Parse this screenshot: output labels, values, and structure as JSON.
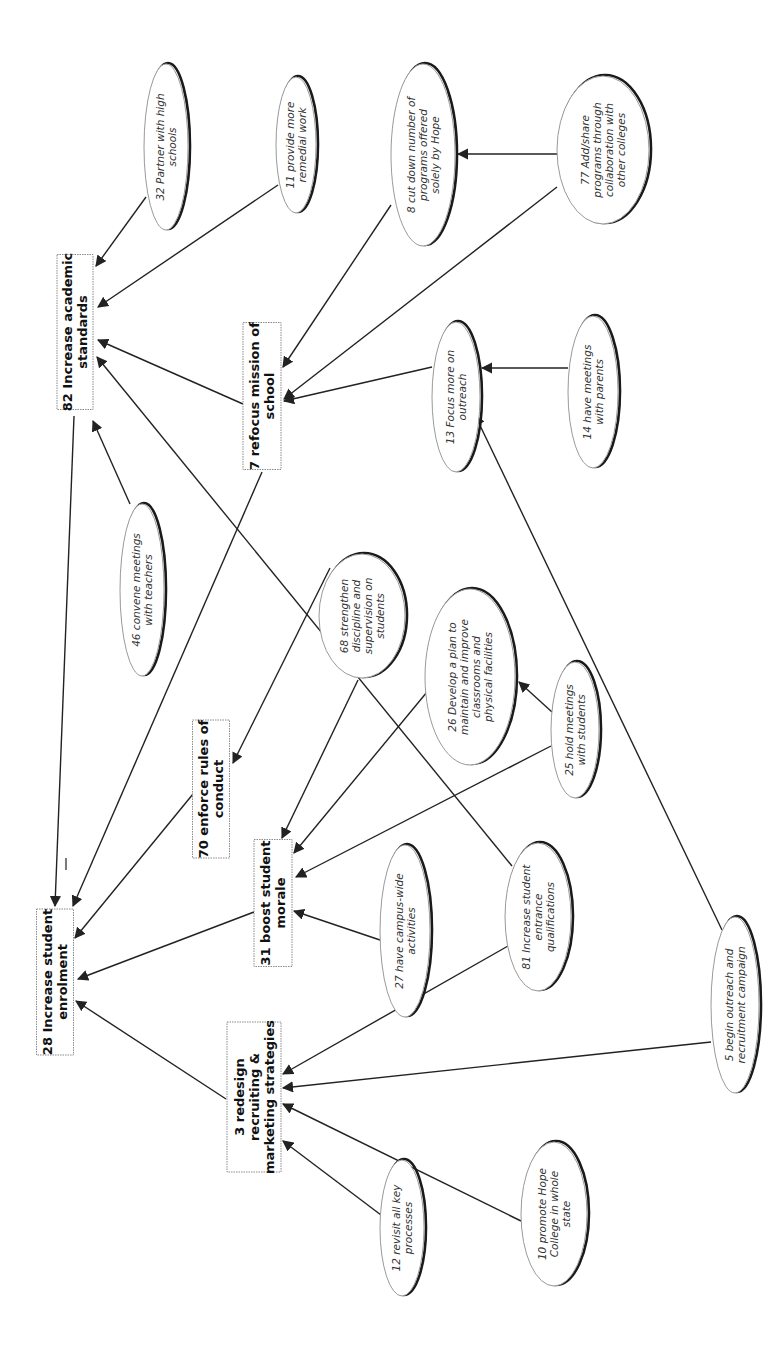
{
  "diagram": {
    "orientation": "rotated -90 degrees (text reads bottom-to-top)",
    "nodes": [
      {
        "id": "82",
        "type": "box",
        "lines": [
          "82 Increase academic",
          "standards"
        ],
        "cx": 75,
        "cy": 332,
        "w": 36,
        "h": 155
      },
      {
        "id": "7",
        "type": "box",
        "lines": [
          "7 refocus mission of",
          "school"
        ],
        "cx": 262,
        "cy": 396,
        "w": 38,
        "h": 147
      },
      {
        "id": "70",
        "type": "box",
        "lines": [
          "70 enforce rules of",
          "conduct"
        ],
        "cx": 211,
        "cy": 789,
        "w": 37,
        "h": 138
      },
      {
        "id": "28",
        "type": "box",
        "lines": [
          "28 Increase student",
          "enrolment"
        ],
        "cx": 55,
        "cy": 982,
        "w": 37,
        "h": 146
      },
      {
        "id": "31",
        "type": "box",
        "lines": [
          "31 boost student",
          "morale"
        ],
        "cx": 273,
        "cy": 903,
        "w": 38,
        "h": 127
      },
      {
        "id": "3",
        "type": "box",
        "lines": [
          "3 redesign",
          "recruiting &",
          "marketing strategies"
        ],
        "cx": 254,
        "cy": 1097,
        "w": 54,
        "h": 150
      },
      {
        "id": "32",
        "type": "oval",
        "lines": [
          "32 Partner with high",
          "schools"
        ],
        "cx": 166,
        "cy": 147,
        "rx": 22,
        "ry": 83
      },
      {
        "id": "11",
        "type": "oval",
        "lines": [
          "11 provide more",
          "remedial work"
        ],
        "cx": 296,
        "cy": 145,
        "rx": 20,
        "ry": 68
      },
      {
        "id": "8",
        "type": "oval",
        "lines": [
          "8 cut down number of",
          "programs offered",
          "solely by Hope"
        ],
        "cx": 423,
        "cy": 155,
        "rx": 32,
        "ry": 91
      },
      {
        "id": "77",
        "type": "oval",
        "lines": [
          "77 Add/share",
          "programs through",
          "collaboration with",
          "other colleges"
        ],
        "cx": 603,
        "cy": 150,
        "rx": 46,
        "ry": 74
      },
      {
        "id": "13",
        "type": "oval",
        "lines": [
          "13 Focus more on",
          "outreach"
        ],
        "cx": 456,
        "cy": 397,
        "rx": 24,
        "ry": 75
      },
      {
        "id": "14",
        "type": "oval",
        "lines": [
          "14 have meetings",
          "with parents"
        ],
        "cx": 593,
        "cy": 392,
        "rx": 25,
        "ry": 76
      },
      {
        "id": "46",
        "type": "oval",
        "lines": [
          "46 convene meetings",
          "with teachers"
        ],
        "cx": 142,
        "cy": 590,
        "rx": 22,
        "ry": 86
      },
      {
        "id": "68",
        "type": "oval",
        "lines": [
          "68 strengthen",
          "discipline and",
          "supervision on",
          "students"
        ],
        "cx": 362,
        "cy": 616,
        "rx": 43,
        "ry": 62
      },
      {
        "id": "26",
        "type": "oval",
        "lines": [
          "26 Develop a plan to",
          "maintain and improve",
          "classrooms and",
          "physical facilities"
        ],
        "cx": 470,
        "cy": 677,
        "rx": 45,
        "ry": 88
      },
      {
        "id": "25",
        "type": "oval",
        "lines": [
          "25 hold meetings",
          "with students"
        ],
        "cx": 575,
        "cy": 730,
        "rx": 24,
        "ry": 68
      },
      {
        "id": "27",
        "type": "oval",
        "lines": [
          "27 have campus-wide",
          "activities"
        ],
        "cx": 405,
        "cy": 931,
        "rx": 25,
        "ry": 86
      },
      {
        "id": "81",
        "type": "oval",
        "lines": [
          "81 Increase student",
          "entrance",
          "qualifications"
        ],
        "cx": 538,
        "cy": 917,
        "rx": 33,
        "ry": 74
      },
      {
        "id": "5",
        "type": "oval",
        "lines": [
          "5 begin outreach and",
          "recruitment campaign"
        ],
        "cx": 735,
        "cy": 1005,
        "rx": 24,
        "ry": 88
      },
      {
        "id": "12",
        "type": "oval",
        "lines": [
          "12 revisit all key",
          "processes"
        ],
        "cx": 402,
        "cy": 1228,
        "rx": 22,
        "ry": 68
      },
      {
        "id": "10",
        "type": "oval",
        "lines": [
          "10 promote Hope",
          "College in whole",
          "state"
        ],
        "cx": 554,
        "cy": 1214,
        "rx": 33,
        "ry": 72
      }
    ],
    "edges": [
      {
        "from": "32",
        "to": "82",
        "x1": 146,
        "y1": 197,
        "x2": 96,
        "y2": 266
      },
      {
        "from": "11",
        "to": "82",
        "x1": 278,
        "y1": 185,
        "x2": 98,
        "y2": 307
      },
      {
        "from": "7",
        "to": "82",
        "x1": 243,
        "y1": 404,
        "x2": 98,
        "y2": 340
      },
      {
        "from": "81",
        "to": "82",
        "x1": 512,
        "y1": 866,
        "x2": 97,
        "y2": 357
      },
      {
        "from": "46",
        "to": "82",
        "x1": 130,
        "y1": 504,
        "x2": 93,
        "y2": 421
      },
      {
        "from": "8",
        "to": "7",
        "x1": 391,
        "y1": 205,
        "x2": 283,
        "y2": 367
      },
      {
        "from": "77",
        "to": "7",
        "x1": 557,
        "y1": 187,
        "x2": 284,
        "y2": 399
      },
      {
        "from": "13",
        "to": "7",
        "x1": 432,
        "y1": 367,
        "x2": 284,
        "y2": 401
      },
      {
        "from": "77",
        "to": "8",
        "x1": 557,
        "y1": 154,
        "x2": 458,
        "y2": 154
      },
      {
        "from": "14",
        "to": "13",
        "x1": 568,
        "y1": 368,
        "x2": 482,
        "y2": 368
      },
      {
        "from": "5",
        "to": "13",
        "x1": 722,
        "y1": 930,
        "x2": 475,
        "y2": 415
      },
      {
        "from": "82",
        "to": "28",
        "x1": 74,
        "y1": 416,
        "x2": 55,
        "y2": 906
      },
      {
        "from": "7",
        "to": "28",
        "x1": 262,
        "y1": 472,
        "x2": 73,
        "y2": 906
      },
      {
        "from": "70",
        "to": "28",
        "x1": 193,
        "y1": 794,
        "x2": 75,
        "y2": 938
      },
      {
        "from": "31",
        "to": "28",
        "x1": 254,
        "y1": 912,
        "x2": 78,
        "y2": 979
      },
      {
        "from": "3",
        "to": "28",
        "x1": 226,
        "y1": 1099,
        "x2": 76,
        "y2": 1001
      },
      {
        "from": "68",
        "to": "70",
        "x1": 330,
        "y1": 568,
        "x2": 233,
        "y2": 763
      },
      {
        "from": "68",
        "to": "31",
        "x1": 358,
        "y1": 680,
        "x2": 282,
        "y2": 838
      },
      {
        "from": "26",
        "to": "31",
        "x1": 427,
        "y1": 692,
        "x2": 294,
        "y2": 853
      },
      {
        "from": "25",
        "to": "31",
        "x1": 551,
        "y1": 746,
        "x2": 296,
        "y2": 877
      },
      {
        "from": "27",
        "to": "31",
        "x1": 380,
        "y1": 940,
        "x2": 294,
        "y2": 911
      },
      {
        "from": "25",
        "to": "26",
        "x1": 552,
        "y1": 712,
        "x2": 519,
        "y2": 682
      },
      {
        "from": "81",
        "to": "3",
        "x1": 508,
        "y1": 946,
        "x2": 283,
        "y2": 1074
      },
      {
        "from": "5",
        "to": "3",
        "x1": 711,
        "y1": 1042,
        "x2": 283,
        "y2": 1088
      },
      {
        "from": "10",
        "to": "3",
        "x1": 521,
        "y1": 1221,
        "x2": 283,
        "y2": 1104
      },
      {
        "from": "12",
        "to": "3",
        "x1": 381,
        "y1": 1215,
        "x2": 283,
        "y2": 1141
      }
    ],
    "annotations": [
      {
        "label": "minus-sign",
        "x1": 66,
        "y1": 858,
        "x2": 66,
        "y2": 870
      }
    ]
  }
}
